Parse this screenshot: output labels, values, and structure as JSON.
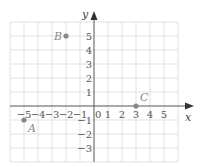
{
  "diagram": {
    "type": "coordinate-plane",
    "axes": {
      "x_label": "x",
      "y_label": "y",
      "x_range": [
        -6,
        6
      ],
      "y_range": [
        -4,
        6
      ],
      "x_ticks": [
        {
          "value": -5,
          "label": "−5"
        },
        {
          "value": -4,
          "label": "−4"
        },
        {
          "value": -3,
          "label": "−3"
        },
        {
          "value": -2,
          "label": "−2"
        },
        {
          "value": -1,
          "label": "−1"
        },
        {
          "value": 1,
          "label": "1"
        },
        {
          "value": 2,
          "label": "2"
        },
        {
          "value": 3,
          "label": "3"
        },
        {
          "value": 4,
          "label": "4"
        },
        {
          "value": 5,
          "label": "5"
        }
      ],
      "y_ticks": [
        {
          "value": 5,
          "label": "5"
        },
        {
          "value": 4,
          "label": "4"
        },
        {
          "value": 3,
          "label": "3"
        },
        {
          "value": 2,
          "label": "2"
        },
        {
          "value": 1,
          "label": "1"
        },
        {
          "value": -1,
          "label": "−1"
        },
        {
          "value": -2,
          "label": "−2"
        },
        {
          "value": -3,
          "label": "−3"
        }
      ],
      "origin_label": "0"
    },
    "points": [
      {
        "name": "A",
        "x": -5,
        "y": -1
      },
      {
        "name": "B",
        "x": -2,
        "y": 5
      },
      {
        "name": "C",
        "x": 3,
        "y": 0
      }
    ],
    "colors": {
      "grid": "#d9d9d9",
      "axis": "#555555",
      "point": "#888888"
    }
  }
}
